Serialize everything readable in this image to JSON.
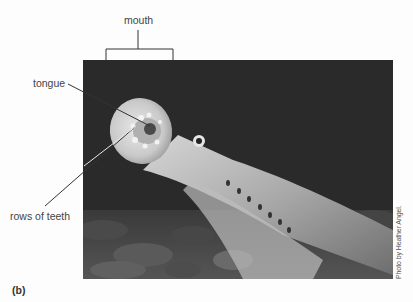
{
  "figure": {
    "panel_label": "(b)",
    "photo_credit": "Photo by Heather Angel.",
    "photo_subject": "lamprey oral disc",
    "labels": {
      "mouth": "mouth",
      "tongue": "tongue",
      "teeth": "rows of teeth"
    },
    "colors": {
      "background": "#fdfdfd",
      "photo_background": "#2b2b2b",
      "label_text": "#444444",
      "leader_line": "#333333"
    }
  }
}
